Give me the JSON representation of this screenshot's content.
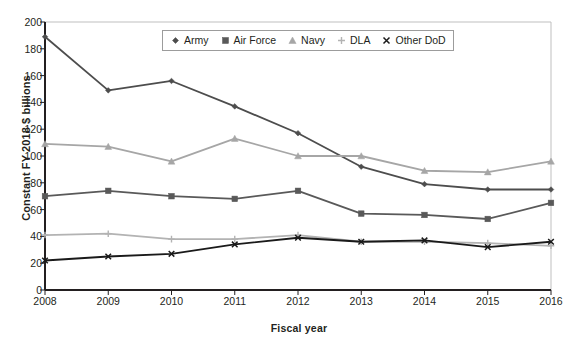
{
  "chart_data": {
    "type": "line",
    "title": "",
    "xlabel": "Fiscal year",
    "ylabel": "Constant FY 2018 $ billions",
    "x": [
      2008,
      2009,
      2010,
      2011,
      2012,
      2013,
      2014,
      2015,
      2016
    ],
    "categories": [
      "2008",
      "2009",
      "2010",
      "2011",
      "2012",
      "2013",
      "2014",
      "2015",
      "2016"
    ],
    "xlim": [
      2008,
      2016
    ],
    "ylim": [
      0,
      200
    ],
    "y_ticks": [
      0,
      20,
      40,
      60,
      80,
      100,
      120,
      140,
      160,
      180,
      200
    ],
    "y_tick_labels": [
      "0",
      "20",
      "40",
      "60",
      "80",
      "100",
      "120",
      "140",
      "160",
      "180",
      "200"
    ],
    "grid": false,
    "legend_position": "top-center-inside",
    "series": [
      {
        "name": "Army",
        "marker": "diamond",
        "color": "#4d4d4d",
        "values": [
          189,
          149,
          156,
          137,
          117,
          92,
          79,
          75,
          75
        ]
      },
      {
        "name": "Air Force",
        "marker": "square",
        "color": "#595959",
        "values": [
          70,
          74,
          70,
          68,
          74,
          57,
          56,
          53,
          65
        ]
      },
      {
        "name": "Navy",
        "marker": "triangle",
        "color": "#a6a6a6",
        "values": [
          109,
          107,
          96,
          113,
          100,
          100,
          89,
          88,
          96
        ]
      },
      {
        "name": "DLA",
        "marker": "plus",
        "color": "#b3b3b3",
        "values": [
          41,
          42,
          38,
          38,
          41,
          36,
          36,
          35,
          33
        ]
      },
      {
        "name": "Other DoD",
        "marker": "x",
        "color": "#1a1a1a",
        "values": [
          22,
          25,
          27,
          34,
          39,
          36,
          37,
          32,
          36
        ]
      }
    ]
  },
  "axis": {
    "y_title": "Constant FY 2018 $ billions",
    "x_title": "Fiscal year"
  },
  "legend": {
    "items": [
      {
        "label": "Army",
        "marker": "diamond",
        "color": "#4d4d4d"
      },
      {
        "label": "Air Force",
        "marker": "square",
        "color": "#595959"
      },
      {
        "label": "Navy",
        "marker": "triangle",
        "color": "#a6a6a6"
      },
      {
        "label": "DLA",
        "marker": "plus",
        "color": "#b3b3b3"
      },
      {
        "label": "Other DoD",
        "marker": "x",
        "color": "#1a1a1a"
      }
    ]
  },
  "colors": {
    "axis": "#231f20",
    "plot_border": "#bfbfbf",
    "background": "#ffffff",
    "legend_border": "#9c9c9c"
  }
}
